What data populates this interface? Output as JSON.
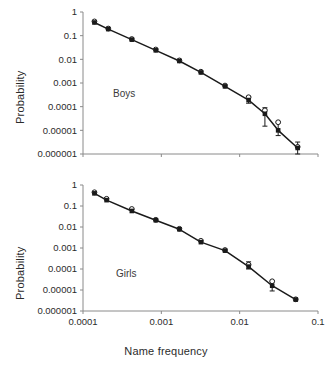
{
  "figure": {
    "xlabel": "Name frequency",
    "ylabel": "Probability",
    "xticklabels": [
      "0.0001",
      "0.001",
      "0.01",
      "0.1"
    ],
    "yticklabels": [
      "1",
      "0.1",
      "0.01",
      "0.001",
      "0.0001",
      "0.00001",
      "0.000001"
    ],
    "line_color": "#1a1a1a",
    "axis_color": "#8a8a8a",
    "text_color": "#2b2b2b"
  },
  "chart_data": [
    {
      "type": "scatter",
      "title": "Boys",
      "panel": "top",
      "xlabel": "",
      "ylabel": "Probability",
      "xscale": "log",
      "yscale": "log",
      "xlim": [
        0.0001,
        0.1
      ],
      "ylim": [
        1e-06,
        1
      ],
      "xticks": [
        0.0001,
        0.001,
        0.01,
        0.1
      ],
      "xticklabels": [
        "",
        "",
        "",
        ""
      ],
      "yticks": [
        1,
        0.1,
        0.01,
        0.001,
        0.0001,
        1e-05,
        1e-06
      ],
      "yticklabels": [
        "1",
        "0.1",
        "0.01",
        "0.001",
        "0.0001",
        "0.00001",
        "0.000001"
      ],
      "grid": false,
      "legend": false,
      "annotations": [
        "Boys"
      ],
      "series": [
        {
          "name": "observed",
          "marker": "filled-square",
          "x": [
            0.00014,
            0.00021,
            0.00042,
            0.00085,
            0.0017,
            0.0032,
            0.0065,
            0.013,
            0.021,
            0.031,
            0.055
          ],
          "y": [
            0.36,
            0.19,
            0.068,
            0.024,
            0.0085,
            0.0028,
            0.00072,
            0.00019,
            5e-05,
            1e-05,
            1.8e-06
          ],
          "yerr_low": [
            0.0,
            0.0,
            0.0,
            0.0,
            0.0,
            0.0,
            0.0,
            5e-05,
            3.5e-05,
            4e-06,
            9e-07
          ],
          "yerr_high": [
            0.0,
            0.0,
            0.0,
            0.0,
            0.0,
            0.0,
            0.0,
            8e-05,
            4e-05,
            1.2e-05,
            1.4e-06
          ]
        },
        {
          "name": "predicted",
          "marker": "open-circle",
          "x": [
            0.00014,
            0.00021,
            0.00042,
            0.00085,
            0.0017,
            0.0032,
            0.0065,
            0.013,
            0.021,
            0.031,
            0.055
          ],
          "y": [
            0.4,
            0.2,
            0.072,
            0.026,
            0.009,
            0.003,
            0.00078,
            0.00025,
            7e-05,
            2.2e-05,
            2e-06
          ]
        },
        {
          "name": "fit-line",
          "marker": "none",
          "x": [
            0.00014,
            0.055
          ],
          "y": [
            0.38,
            1.8e-06
          ]
        }
      ]
    },
    {
      "type": "scatter",
      "title": "Girls",
      "panel": "bottom",
      "xlabel": "Name frequency",
      "ylabel": "Probability",
      "xscale": "log",
      "yscale": "log",
      "xlim": [
        0.0001,
        0.1
      ],
      "ylim": [
        1e-06,
        1
      ],
      "xticks": [
        0.0001,
        0.001,
        0.01,
        0.1
      ],
      "xticklabels": [
        "0.0001",
        "0.001",
        "0.01",
        "0.1"
      ],
      "yticks": [
        1,
        0.1,
        0.01,
        0.001,
        0.0001,
        1e-05,
        1e-06
      ],
      "yticklabels": [
        "1",
        "0.1",
        "0.01",
        "0.001",
        "0.0001",
        "0.00001",
        "0.000001"
      ],
      "grid": false,
      "legend": false,
      "annotations": [
        "Girls"
      ],
      "series": [
        {
          "name": "observed",
          "marker": "filled-square",
          "x": [
            0.00014,
            0.0002,
            0.00042,
            0.00085,
            0.0017,
            0.0032,
            0.0065,
            0.013,
            0.026,
            0.052
          ],
          "y": [
            0.4,
            0.19,
            0.058,
            0.021,
            0.0078,
            0.0019,
            0.00075,
            0.00013,
            1.6e-05,
            3.5e-06
          ],
          "yerr_low": [
            0.0,
            0.0,
            0.0,
            0.0,
            0.0,
            0.0,
            0.0,
            3e-05,
            7e-06,
            0.0
          ],
          "yerr_high": [
            0.0,
            0.0,
            0.0,
            0.0,
            0.0,
            0.0,
            0.0,
            9e-05,
            1e-05,
            0.0
          ]
        },
        {
          "name": "predicted",
          "marker": "open-circle",
          "x": [
            0.00014,
            0.0002,
            0.00042,
            0.00085,
            0.0017,
            0.0032,
            0.0065,
            0.013,
            0.026,
            0.052
          ],
          "y": [
            0.45,
            0.22,
            0.072,
            0.022,
            0.0082,
            0.0022,
            0.0008,
            0.00016,
            2.6e-05,
            3.6e-06
          ]
        },
        {
          "name": "fit-line",
          "marker": "none",
          "x": [
            0.00014,
            0.052
          ],
          "y": [
            0.42,
            3.5e-06
          ]
        }
      ]
    }
  ]
}
